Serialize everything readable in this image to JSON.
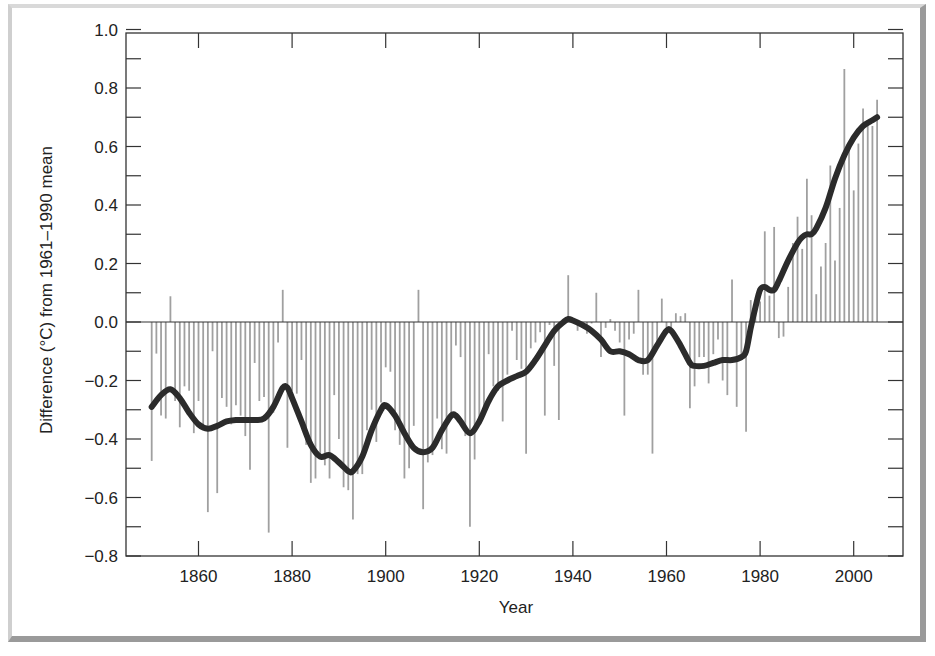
{
  "chart_data": {
    "type": "bar",
    "title": "",
    "xlabel": "Year",
    "ylabel": "Difference (°C) from 1961–1990 mean",
    "xlim": [
      1847,
      2011
    ],
    "ylim": [
      -0.8,
      1.0
    ],
    "x_ticks": [
      1860,
      1880,
      1900,
      1920,
      1940,
      1960,
      1980,
      2000
    ],
    "y_ticks": [
      1.0,
      0.8,
      0.6,
      0.4,
      0.2,
      0.0,
      -0.2,
      -0.4,
      -0.6,
      -0.8
    ],
    "y_tick_labels": [
      "1.0",
      "0.8",
      "0.6",
      "0.4",
      "0.2",
      "0.0",
      "−0.2",
      "−0.4",
      "−0.6",
      "−0.8"
    ],
    "grid": false,
    "legend": null,
    "series": [
      {
        "name": "Annual anomaly",
        "type": "bar",
        "color": "#a0a0a0",
        "x": [
          1850,
          1851,
          1852,
          1853,
          1854,
          1855,
          1856,
          1857,
          1858,
          1859,
          1860,
          1861,
          1862,
          1863,
          1864,
          1865,
          1866,
          1867,
          1868,
          1869,
          1870,
          1871,
          1872,
          1873,
          1874,
          1875,
          1876,
          1877,
          1878,
          1879,
          1880,
          1881,
          1882,
          1883,
          1884,
          1885,
          1886,
          1887,
          1888,
          1889,
          1890,
          1891,
          1892,
          1893,
          1894,
          1895,
          1896,
          1897,
          1898,
          1899,
          1900,
          1901,
          1902,
          1903,
          1904,
          1905,
          1906,
          1907,
          1908,
          1909,
          1910,
          1911,
          1912,
          1913,
          1914,
          1915,
          1916,
          1917,
          1918,
          1919,
          1920,
          1921,
          1922,
          1923,
          1924,
          1925,
          1926,
          1927,
          1928,
          1929,
          1930,
          1931,
          1932,
          1933,
          1934,
          1935,
          1936,
          1937,
          1938,
          1939,
          1940,
          1941,
          1942,
          1943,
          1944,
          1945,
          1946,
          1947,
          1948,
          1949,
          1950,
          1951,
          1952,
          1953,
          1954,
          1955,
          1956,
          1957,
          1958,
          1959,
          1960,
          1961,
          1962,
          1963,
          1964,
          1965,
          1966,
          1967,
          1968,
          1969,
          1970,
          1971,
          1972,
          1973,
          1974,
          1975,
          1976,
          1977,
          1978,
          1979,
          1980,
          1981,
          1982,
          1983,
          1984,
          1985,
          1986,
          1987,
          1988,
          1989,
          1990,
          1991,
          1992,
          1993,
          1994,
          1995,
          1996,
          1997,
          1998,
          1999,
          2000,
          2001,
          2002,
          2003,
          2004,
          2005
        ],
        "values": [
          -0.475,
          -0.108,
          -0.32,
          -0.33,
          0.088,
          -0.27,
          -0.36,
          -0.22,
          -0.235,
          -0.38,
          -0.27,
          -0.37,
          -0.65,
          -0.1,
          -0.585,
          -0.26,
          -0.29,
          -0.35,
          -0.285,
          -0.32,
          -0.39,
          -0.505,
          -0.14,
          -0.27,
          -0.256,
          -0.72,
          -0.31,
          -0.07,
          0.11,
          -0.43,
          -0.235,
          -0.245,
          -0.13,
          -0.42,
          -0.55,
          -0.535,
          -0.46,
          -0.49,
          -0.535,
          -0.25,
          -0.4,
          -0.565,
          -0.575,
          -0.675,
          -0.52,
          -0.52,
          -0.37,
          -0.3,
          -0.41,
          -0.275,
          -0.155,
          -0.17,
          -0.37,
          -0.42,
          -0.535,
          -0.5,
          -0.355,
          0.11,
          -0.64,
          -0.48,
          -0.455,
          -0.33,
          -0.435,
          -0.45,
          -0.32,
          -0.08,
          -0.12,
          -0.39,
          -0.7,
          -0.47,
          -0.34,
          -0.29,
          -0.11,
          -0.22,
          -0.235,
          -0.34,
          -0.18,
          -0.03,
          -0.13,
          -0.16,
          -0.45,
          -0.09,
          -0.07,
          -0.035,
          -0.32,
          -0.01,
          -0.15,
          -0.335,
          -0.01,
          0.16,
          0.01,
          -0.03,
          -0.02,
          -0.04,
          -0.005,
          0.1,
          -0.12,
          -0.02,
          0.01,
          -0.03,
          -0.07,
          -0.32,
          -0.06,
          -0.04,
          0.11,
          -0.18,
          -0.18,
          -0.45,
          -0.07,
          0.08,
          -0.02,
          -0.03,
          0.03,
          0.02,
          0.03,
          -0.295,
          -0.22,
          -0.12,
          -0.12,
          -0.21,
          -0.11,
          -0.06,
          -0.2,
          -0.25,
          0.145,
          -0.29,
          -0.13,
          -0.375,
          0.075,
          0.05,
          0.07,
          0.31,
          0.09,
          0.325,
          -0.055,
          -0.05,
          0.12,
          0.27,
          0.36,
          0.25,
          0.49,
          0.365,
          0.095,
          0.19,
          0.27,
          0.535,
          0.21,
          0.39,
          0.865,
          0.59,
          0.45,
          0.61,
          0.73,
          0.69,
          0.67,
          0.76
        ]
      },
      {
        "name": "Smoothed trend",
        "type": "line",
        "color": "#2b2b2b",
        "x": [
          1850,
          1852,
          1854,
          1856,
          1858,
          1860,
          1862,
          1864,
          1866,
          1868,
          1870,
          1872,
          1874,
          1876,
          1878,
          1879,
          1880,
          1882,
          1884,
          1886,
          1888,
          1890,
          1892,
          1893,
          1895,
          1897,
          1899,
          1900,
          1902,
          1904,
          1906,
          1908,
          1910,
          1912,
          1914,
          1915,
          1916,
          1918,
          1920,
          1922,
          1924,
          1926,
          1928,
          1930,
          1932,
          1934,
          1936,
          1938,
          1939,
          1940,
          1942,
          1944,
          1946,
          1948,
          1950,
          1952,
          1954,
          1956,
          1958,
          1960,
          1961,
          1963,
          1965,
          1966,
          1968,
          1970,
          1972,
          1974,
          1976,
          1977,
          1978,
          1979,
          1980,
          1981,
          1982,
          1983,
          1984,
          1986,
          1988,
          1989,
          1990,
          1991,
          1992,
          1994,
          1996,
          1998,
          2000,
          2002,
          2004,
          2005
        ],
        "values": [
          -0.29,
          -0.25,
          -0.23,
          -0.26,
          -0.31,
          -0.35,
          -0.365,
          -0.355,
          -0.34,
          -0.335,
          -0.335,
          -0.335,
          -0.33,
          -0.29,
          -0.225,
          -0.225,
          -0.26,
          -0.34,
          -0.42,
          -0.46,
          -0.455,
          -0.48,
          -0.51,
          -0.51,
          -0.46,
          -0.37,
          -0.3,
          -0.285,
          -0.32,
          -0.38,
          -0.43,
          -0.445,
          -0.43,
          -0.37,
          -0.32,
          -0.32,
          -0.34,
          -0.38,
          -0.34,
          -0.27,
          -0.22,
          -0.2,
          -0.185,
          -0.17,
          -0.13,
          -0.08,
          -0.03,
          0.0,
          0.01,
          0.005,
          -0.01,
          -0.03,
          -0.06,
          -0.1,
          -0.1,
          -0.11,
          -0.13,
          -0.13,
          -0.08,
          -0.03,
          -0.03,
          -0.08,
          -0.14,
          -0.15,
          -0.15,
          -0.14,
          -0.13,
          -0.13,
          -0.12,
          -0.1,
          -0.02,
          0.05,
          0.11,
          0.12,
          0.11,
          0.11,
          0.14,
          0.21,
          0.27,
          0.29,
          0.3,
          0.3,
          0.32,
          0.39,
          0.49,
          0.57,
          0.63,
          0.67,
          0.69,
          0.7
        ]
      }
    ]
  },
  "axes": {
    "x_title": "Year",
    "y_title": "Difference (°C) from 1961–1990 mean"
  },
  "colors": {
    "bar": "#a0a0a0",
    "line": "#2b2b2b",
    "axis": "#333333"
  }
}
